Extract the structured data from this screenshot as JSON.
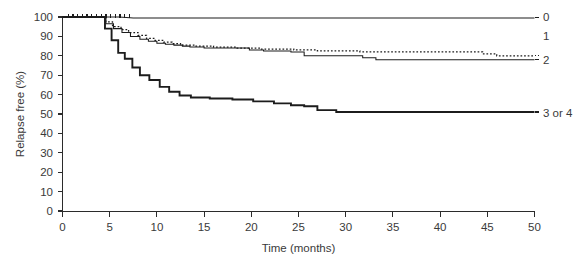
{
  "chart_data": {
    "type": "line",
    "title": "",
    "subtitle": "",
    "xlabel": "Time (months)",
    "ylabel": "Relapse free (%)",
    "xlim": [
      0,
      50
    ],
    "ylim": [
      0,
      100
    ],
    "xticks": [
      0,
      5,
      10,
      15,
      20,
      25,
      30,
      35,
      40,
      45,
      50
    ],
    "yticks": [
      0,
      10,
      20,
      30,
      40,
      50,
      60,
      70,
      80,
      90,
      100
    ],
    "xtick_labels": [
      "0",
      "5",
      "10",
      "15",
      "20",
      "25",
      "30",
      "35",
      "40",
      "45",
      "50"
    ],
    "ytick_labels": [
      "0",
      "10",
      "20",
      "30",
      "40",
      "50",
      "60",
      "70",
      "80",
      "90",
      "100"
    ],
    "grid": false,
    "legend_position": "right-of-plot-inline",
    "curve_style": "kaplan-meier-step",
    "series": [
      {
        "name": "0",
        "label": "0",
        "style": "solid-thin",
        "label_x": 50.9,
        "label_y": 100.0,
        "final_value": 99.5,
        "x": [
          0,
          1.0,
          2.0,
          3.0,
          4.0,
          5.0,
          6.0,
          7.5,
          9.0,
          11.0,
          50.0
        ],
        "y": [
          100,
          100,
          100,
          100,
          100,
          100,
          100,
          99.5,
          99.5,
          99.5,
          99.5
        ],
        "censor_x": [
          0.6,
          1.1,
          1.6,
          2.1,
          2.6,
          3.1,
          3.6,
          4.1,
          4.6,
          5.1,
          5.6,
          6.1,
          6.6,
          7.1
        ],
        "censor_y": [
          100,
          100,
          100,
          100,
          100,
          100,
          100,
          100,
          100,
          100,
          100,
          100,
          100,
          100
        ]
      },
      {
        "name": "1",
        "label": "1",
        "style": "dotted",
        "label_x": 50.9,
        "label_y": 90.0,
        "final_value": 80.0,
        "x": [
          0,
          4.6,
          4.6,
          5.3,
          5.3,
          6.2,
          6.2,
          7.0,
          7.0,
          8.0,
          8.0,
          8.9,
          8.9,
          9.8,
          9.8,
          10.7,
          10.7,
          11.6,
          11.6,
          12.5,
          12.5,
          14.0,
          14.0,
          16.0,
          16.0,
          18.5,
          18.5,
          21.0,
          21.0,
          24.5,
          24.5,
          27.0,
          27.0,
          31.5,
          31.5,
          44.5,
          44.5,
          46.0,
          46.0,
          50.0
        ],
        "y": [
          100,
          100,
          97.5,
          97.5,
          95.0,
          95.0,
          93.5,
          93.5,
          92.0,
          92.0,
          90.5,
          90.5,
          89.0,
          89.0,
          88.0,
          88.0,
          87.0,
          87.0,
          86.3,
          86.3,
          85.5,
          85.5,
          85.0,
          85.0,
          84.5,
          84.5,
          84.0,
          84.0,
          83.5,
          83.5,
          83.0,
          83.0,
          82.5,
          82.5,
          82.0,
          82.0,
          81.0,
          81.0,
          80.0,
          80.0
        ]
      },
      {
        "name": "2",
        "label": "2",
        "style": "solid-thin",
        "label_x": 50.9,
        "label_y": 78.0,
        "final_value": 78.0,
        "x": [
          0,
          4.6,
          4.6,
          5.4,
          5.4,
          6.3,
          6.3,
          7.2,
          7.2,
          8.2,
          8.2,
          9.1,
          9.1,
          10.0,
          10.0,
          10.9,
          10.9,
          11.8,
          11.8,
          12.7,
          12.7,
          13.5,
          13.5,
          15.0,
          15.0,
          19.8,
          19.8,
          21.3,
          21.3,
          24.2,
          24.2,
          25.6,
          25.6,
          31.8,
          31.8,
          33.2,
          33.2,
          50.0
        ],
        "y": [
          100,
          100,
          96.5,
          96.5,
          94.0,
          94.0,
          92.0,
          92.0,
          90.0,
          90.0,
          88.5,
          88.5,
          87.5,
          87.5,
          86.5,
          86.5,
          86.0,
          86.0,
          85.5,
          85.5,
          85.0,
          85.0,
          84.5,
          84.5,
          84.0,
          84.0,
          83.0,
          83.0,
          82.5,
          82.5,
          82.0,
          82.0,
          80.0,
          80.0,
          79.0,
          79.0,
          78.0,
          78.0
        ]
      },
      {
        "name": "3 or 4",
        "label": "3 or 4",
        "style": "solid-bold",
        "label_x": 50.9,
        "label_y": 50.5,
        "final_value": 51.0,
        "x": [
          0,
          4.5,
          4.5,
          5.2,
          5.2,
          5.9,
          5.9,
          6.6,
          6.6,
          7.4,
          7.4,
          8.2,
          8.2,
          9.2,
          9.2,
          10.3,
          10.3,
          11.3,
          11.3,
          12.4,
          12.4,
          13.6,
          13.6,
          15.6,
          15.6,
          18.0,
          18.0,
          20.2,
          20.2,
          22.4,
          22.4,
          24.2,
          24.2,
          25.6,
          25.6,
          27.0,
          27.0,
          29.0,
          29.0,
          50.0
        ],
        "y": [
          100,
          100,
          94.0,
          94.0,
          88.0,
          88.0,
          81.5,
          81.5,
          78.5,
          78.5,
          74.0,
          74.0,
          70.0,
          70.0,
          67.5,
          67.5,
          64.0,
          64.0,
          61.5,
          61.5,
          59.5,
          59.5,
          58.5,
          58.5,
          58.0,
          58.0,
          57.5,
          57.5,
          56.5,
          56.5,
          55.5,
          55.5,
          54.5,
          54.5,
          54.0,
          54.0,
          52.0,
          52.0,
          51.0,
          51.0
        ]
      }
    ]
  }
}
